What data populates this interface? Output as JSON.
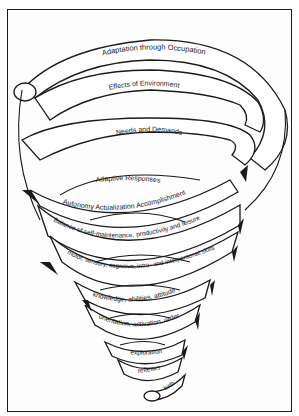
{
  "diagram": {
    "type": "spiral",
    "colors": {
      "line": "#1a1a1a",
      "background": "#ffffff"
    },
    "levels": [
      {
        "id": "adaptation",
        "label": "Adaptation through Occupation"
      },
      {
        "id": "environment",
        "label": "Effects of Environment"
      },
      {
        "id": "needs",
        "label": "Needs and Demands"
      },
      {
        "id": "adaptive",
        "label": "Adaptive Responses"
      },
      {
        "id": "autonomy",
        "label": "Autonomy  Actualization  Accomplishment"
      },
      {
        "id": "balance",
        "label": "Balance of self-maintenance, productivity and leisure"
      },
      {
        "id": "skills",
        "label": "motor, sensory, cognitive, intra- and interpersonal skills"
      },
      {
        "id": "knowledge",
        "label": "knowledge, abilities, attitude"
      },
      {
        "id": "orientation",
        "label": "orientation, activation, order"
      },
      {
        "id": "exploration",
        "label": "exploration"
      },
      {
        "id": "reflexes",
        "label": "reflexes"
      },
      {
        "id": "birth",
        "label": "birth"
      }
    ]
  }
}
